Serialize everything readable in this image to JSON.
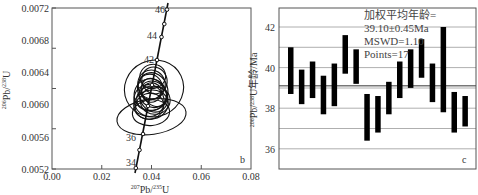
{
  "chart_data": [
    {
      "type": "scatter",
      "subtype": "concordia-ellipses",
      "panel_label": "b",
      "xlabel": "207Pb/235U",
      "ylabel": "206Pb/238U",
      "xlim": [
        0.0,
        0.08
      ],
      "ylim": [
        0.0052,
        0.0072
      ],
      "x_ticks": [
        "0.00",
        "0.02",
        "0.04",
        "0.06",
        "0.08"
      ],
      "y_ticks": [
        "0.0052",
        "0.0056",
        "0.0060",
        "0.0064",
        "0.0068",
        "0.0072"
      ],
      "grid": false,
      "concordia_labels": [
        {
          "age": "46",
          "x": 0.0462,
          "y": 0.00718
        },
        {
          "age": "44",
          "x": 0.044,
          "y": 0.00684
        },
        {
          "age": "42",
          "x": 0.0421,
          "y": 0.00654
        },
        {
          "age": "36",
          "x": 0.0366,
          "y": 0.00561
        },
        {
          "age": "34",
          "x": 0.0337,
          "y": 0.0053
        }
      ],
      "ellipses": [
        {
          "cx": 0.041,
          "cy": 0.0062,
          "rx": 0.012,
          "ry": 0.00035,
          "angle": -25
        },
        {
          "cx": 0.04,
          "cy": 0.00585,
          "rx": 0.014,
          "ry": 0.00022,
          "angle": -8
        },
        {
          "cx": 0.0395,
          "cy": 0.00612,
          "rx": 0.0065,
          "ry": 0.0002,
          "angle": -20
        },
        {
          "cx": 0.0405,
          "cy": 0.00618,
          "rx": 0.006,
          "ry": 0.00022,
          "angle": -18
        },
        {
          "cx": 0.04,
          "cy": 0.00625,
          "rx": 0.0055,
          "ry": 0.00018,
          "angle": -15
        },
        {
          "cx": 0.039,
          "cy": 0.00605,
          "rx": 0.006,
          "ry": 0.0002,
          "angle": -22
        },
        {
          "cx": 0.0412,
          "cy": 0.0063,
          "rx": 0.005,
          "ry": 0.00017,
          "angle": -25
        },
        {
          "cx": 0.0398,
          "cy": 0.006,
          "rx": 0.007,
          "ry": 0.00018,
          "angle": -12
        },
        {
          "cx": 0.0408,
          "cy": 0.0061,
          "rx": 0.0055,
          "ry": 0.0002,
          "angle": -30
        },
        {
          "cx": 0.0395,
          "cy": 0.00622,
          "rx": 0.0048,
          "ry": 0.00016,
          "angle": -20
        },
        {
          "cx": 0.0402,
          "cy": 0.00608,
          "rx": 0.0062,
          "ry": 0.00015,
          "angle": -10
        },
        {
          "cx": 0.041,
          "cy": 0.00615,
          "rx": 0.0045,
          "ry": 0.00019,
          "angle": -35
        },
        {
          "cx": 0.0392,
          "cy": 0.00598,
          "rx": 0.0058,
          "ry": 0.00016,
          "angle": -18
        },
        {
          "cx": 0.0405,
          "cy": 0.00635,
          "rx": 0.0052,
          "ry": 0.00015,
          "angle": -15
        },
        {
          "cx": 0.04,
          "cy": 0.00615,
          "rx": 0.004,
          "ry": 0.00012,
          "angle": -25
        },
        {
          "cx": 0.0415,
          "cy": 0.00605,
          "rx": 0.006,
          "ry": 0.00017,
          "angle": -10
        },
        {
          "cx": 0.0398,
          "cy": 0.0059,
          "rx": 0.0075,
          "ry": 0.00016,
          "angle": -6
        }
      ]
    },
    {
      "type": "bar",
      "subtype": "weighted-mean-error-bars",
      "panel_label": "c",
      "xlabel": "",
      "ylabel": "206Pb/238U年龄/Ma",
      "ylim": [
        35.0,
        43.0
      ],
      "y_ticks": [
        "36",
        "38",
        "40",
        "42"
      ],
      "grid": true,
      "annotation": [
        "加权平均年龄=",
        "39.10±0.45Ma",
        "MSWD=1.10",
        "Points=17"
      ],
      "mean_line": 39.1,
      "series": [
        {
          "name": "analyses",
          "low": [
            38.7,
            38.2,
            38.5,
            37.7,
            38.1,
            39.7,
            39.2,
            36.4,
            36.8,
            37.7,
            38.5,
            39.0,
            39.5,
            38.3,
            37.8,
            36.8,
            37.1
          ],
          "high": [
            41.0,
            39.9,
            40.3,
            39.6,
            40.2,
            41.6,
            40.9,
            38.7,
            38.6,
            39.3,
            40.3,
            40.9,
            41.4,
            40.2,
            42.0,
            38.8,
            38.6
          ]
        }
      ],
      "categories": [
        "1",
        "2",
        "3",
        "4",
        "5",
        "6",
        "7",
        "8",
        "9",
        "10",
        "11",
        "12",
        "13",
        "14",
        "15",
        "16",
        "17"
      ]
    }
  ],
  "panel_b": {
    "x_ticks": [
      "0.00",
      "0.02",
      "0.04",
      "0.06",
      "0.08"
    ],
    "y_ticks": [
      "0.0052",
      "0.0056",
      "0.0060",
      "0.0064",
      "0.0068",
      "0.0072"
    ],
    "xlabel_sup": "207",
    "xlabel_main": "Pb/",
    "xlabel_sup2": "235",
    "xlabel_end": "U",
    "ylabel_sup": "206",
    "ylabel_main": "Pb/",
    "ylabel_sup2": "238",
    "ylabel_end": "U",
    "letter": "b",
    "conc": [
      "46",
      "44",
      "42",
      "36",
      "34"
    ]
  },
  "panel_c": {
    "y_ticks": [
      "42",
      "40",
      "38",
      "36"
    ],
    "ylabel_sup": "206",
    "ylabel_main": "Pb/",
    "ylabel_sup2": "238",
    "ylabel_end": "U年龄/Ma",
    "annot": [
      "加权平均年龄=",
      "39.10±0.45Ma",
      "MSWD=1.10",
      "Points=17"
    ],
    "letter": "c",
    "colors": {
      "bar": "#000000",
      "grid": "#9a9a9a",
      "mean": "#777777",
      "frame": "#555555"
    }
  }
}
